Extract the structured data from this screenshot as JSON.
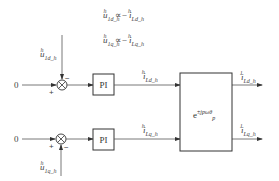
{
  "equations": {
    "eq1": {
      "lhs": "u",
      "lhs_sup": "h",
      "lhs_sub": "1d_h",
      "rel": "∝",
      "rhs_sign": "−",
      "rhs": "i",
      "rhs_sup": "h",
      "rhs_sub": "Ld_h"
    },
    "eq2": {
      "lhs": "u",
      "lhs_sup": "h",
      "lhs_sub": "1q_h",
      "rel": "∝",
      "rhs_sign": "−",
      "rhs": "i",
      "rhs_sup": "h",
      "rhs_sub": "Lq_h"
    }
  },
  "top_path": {
    "input": "0",
    "plus_sign": "+",
    "minus_sign": "−",
    "feedback": {
      "sym": "u",
      "sup": "h",
      "sub": "1d_h"
    },
    "controller": "PI",
    "signal": {
      "sym": "i",
      "sup": "h",
      "sub": "Ld_h"
    },
    "output": {
      "sym": "i",
      "sup": "1",
      "sub": "Ld_h"
    }
  },
  "bottom_path": {
    "input": "0",
    "plus_sign": "+",
    "minus_sign": "−",
    "feedback": {
      "sym": "u",
      "sup": "h",
      "sub": "1q_h"
    },
    "controller": "PI",
    "signal": {
      "sym": "i",
      "sup": "h",
      "sub": "Lq_h"
    },
    "output": {
      "sym": "i",
      "sup": "1",
      "sub": "Lq_h"
    }
  },
  "transform_block": {
    "base": "e",
    "exponent": "±jpωθ",
    "exp_sub": "p"
  },
  "colors": {
    "line": "#333333",
    "text": "#444444",
    "background": "#ffffff"
  }
}
